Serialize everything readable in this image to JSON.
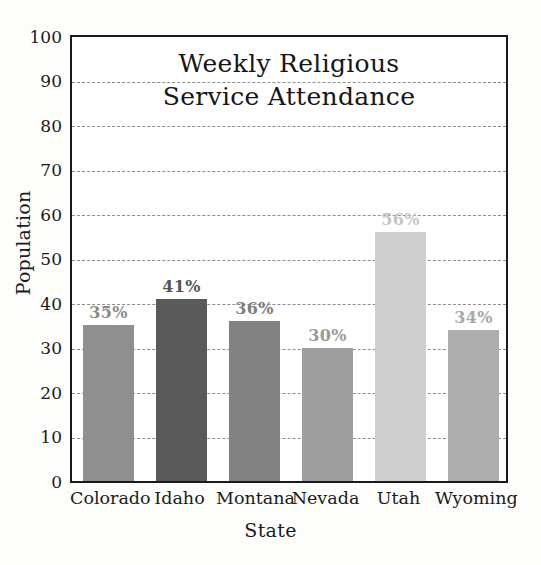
{
  "chart_data": {
    "type": "bar",
    "title_lines": [
      "Weekly Religious",
      "Service Attendance"
    ],
    "xlabel": "State",
    "ylabel": "Population",
    "categories": [
      "Colorado",
      "Idaho",
      "Montana",
      "Nevada",
      "Utah",
      "Wyoming"
    ],
    "values": [
      35,
      41,
      36,
      30,
      56,
      34
    ],
    "data_labels": [
      "35%",
      "41%",
      "36%",
      "30%",
      "56%",
      "34%"
    ],
    "bar_colors": [
      "#8f8f8f",
      "#5a5a5a",
      "#818181",
      "#9e9e9e",
      "#cfcfcf",
      "#aeaeae"
    ],
    "label_colors": [
      "#8a8a8a",
      "#565656",
      "#7d7d7d",
      "#9a9a9a",
      "#c6c6c6",
      "#a8a8a8"
    ],
    "ylim": [
      0,
      100
    ],
    "yticks": [
      0,
      10,
      20,
      30,
      40,
      50,
      60,
      70,
      80,
      90,
      100
    ],
    "ytick_labels": [
      "0",
      "10",
      "20",
      "30",
      "40",
      "50",
      "60",
      "70",
      "80",
      "90",
      "100"
    ],
    "grid": true,
    "grid_style": "dashed",
    "legend": "none",
    "axis_frame_color": "#1a1a1a",
    "plot_background": "#ffffff",
    "figure_background": "#fdfdfb"
  }
}
